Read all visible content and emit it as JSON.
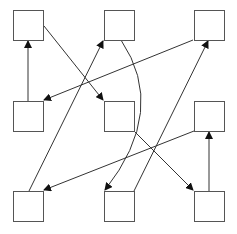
{
  "diagram": {
    "width": 237,
    "height": 234,
    "stroke_color": "#555555",
    "edge_color": "#333333",
    "box_fill": "#ffffff",
    "nodes": [
      {
        "id": "top-left",
        "x": 13,
        "y": 10,
        "w": 30,
        "h": 30
      },
      {
        "id": "top-center",
        "x": 104,
        "y": 10,
        "w": 30,
        "h": 30
      },
      {
        "id": "top-right",
        "x": 194,
        "y": 10,
        "w": 30,
        "h": 30
      },
      {
        "id": "middle-left",
        "x": 13,
        "y": 101,
        "w": 30,
        "h": 30
      },
      {
        "id": "middle-center",
        "x": 104,
        "y": 101,
        "w": 30,
        "h": 30
      },
      {
        "id": "middle-right",
        "x": 194,
        "y": 101,
        "w": 30,
        "h": 30
      },
      {
        "id": "bottom-left",
        "x": 13,
        "y": 191,
        "w": 30,
        "h": 30
      },
      {
        "id": "bottom-center",
        "x": 104,
        "y": 191,
        "w": 30,
        "h": 30
      },
      {
        "id": "bottom-right",
        "x": 194,
        "y": 191,
        "w": 30,
        "h": 30
      }
    ],
    "edges": [
      {
        "from": "middle-left",
        "to": "top-left",
        "path": "M28,101 L28,41"
      },
      {
        "from": "top-left",
        "to": "middle-center",
        "path": "M44,26 L103,100"
      },
      {
        "from": "bottom-left",
        "to": "top-center",
        "path": "M29,191 L103,41"
      },
      {
        "from": "top-right",
        "to": "middle-left",
        "path": "M193,40 L44,100"
      },
      {
        "from": "top-center",
        "to": "bottom-center",
        "path": "M121,40 Q168,110 105,190"
      },
      {
        "from": "bottom-center",
        "to": "top-right",
        "path": "M134,191 L208,41"
      },
      {
        "from": "middle-center",
        "to": "bottom-right",
        "path": "M134,131 L193,190"
      },
      {
        "from": "middle-right",
        "to": "bottom-left",
        "path": "M194,131 L44,190"
      },
      {
        "from": "bottom-right",
        "to": "middle-right",
        "path": "M209,191 L209,132"
      }
    ]
  }
}
